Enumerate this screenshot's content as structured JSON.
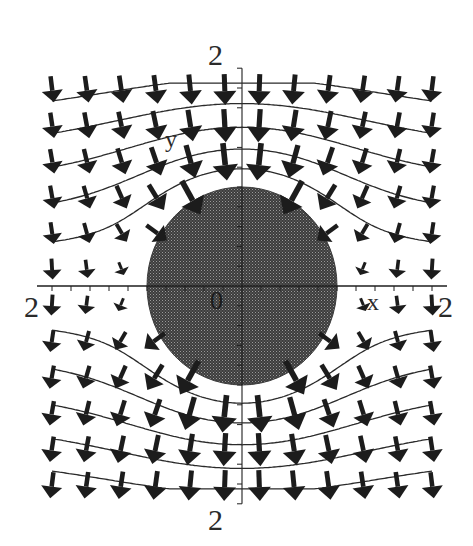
{
  "figure": {
    "background": "#ffffff",
    "ink_color": "#1e1e1e",
    "disk_color": "#4a4a4a",
    "disk_pattern_color": "#8a8a8a"
  },
  "axes": {
    "x_label": "x",
    "y_label": "y",
    "origin_label": "0",
    "x_min_label": "2",
    "x_max_label": "2",
    "y_max_label": "2",
    "y_min_label": "2",
    "x_range": [
      -2,
      2
    ],
    "y_range": [
      -2.2,
      2.2
    ],
    "tick_step": 0.2
  },
  "chart_data": {
    "type": "vector_field",
    "title": "",
    "xlabel": "x",
    "ylabel": "y",
    "xlim": [
      -2,
      2
    ],
    "ylim": [
      -2.2,
      2.2
    ],
    "tick_labels": {
      "x": [
        "2",
        "2"
      ],
      "y": [
        "2",
        "2"
      ],
      "origin": "0"
    },
    "field": {
      "model": "uniform field E0 in -y direction around conductor disk of radius a",
      "E0": 1,
      "radius": 1,
      "potential": "phi = y*(1 - a^2/r^2)",
      "Ex": "-2*a^2*x*y/r^4",
      "Ey": "-[(1 - a^2/r^2) + 2*a^2*y^2/r^4]"
    },
    "arrow_grid": {
      "nx": 12,
      "ny": 12,
      "x": [
        -2,
        2
      ],
      "y": [
        -2,
        2
      ],
      "skip_inside_disk": true
    },
    "equipotentials": [
      1.62,
      1.3,
      0.98,
      0.66,
      0.34,
      -0.34,
      -0.66,
      -0.98,
      -1.3,
      -1.62
    ],
    "grid": false,
    "legend": null
  },
  "layout": {
    "origin_px": [
      242,
      286
    ],
    "x_scale_px_per_unit": 95,
    "y_scale_px_per_unit": 99,
    "arrow_max_len_px": 40,
    "arrow_base_len_px": 26
  }
}
